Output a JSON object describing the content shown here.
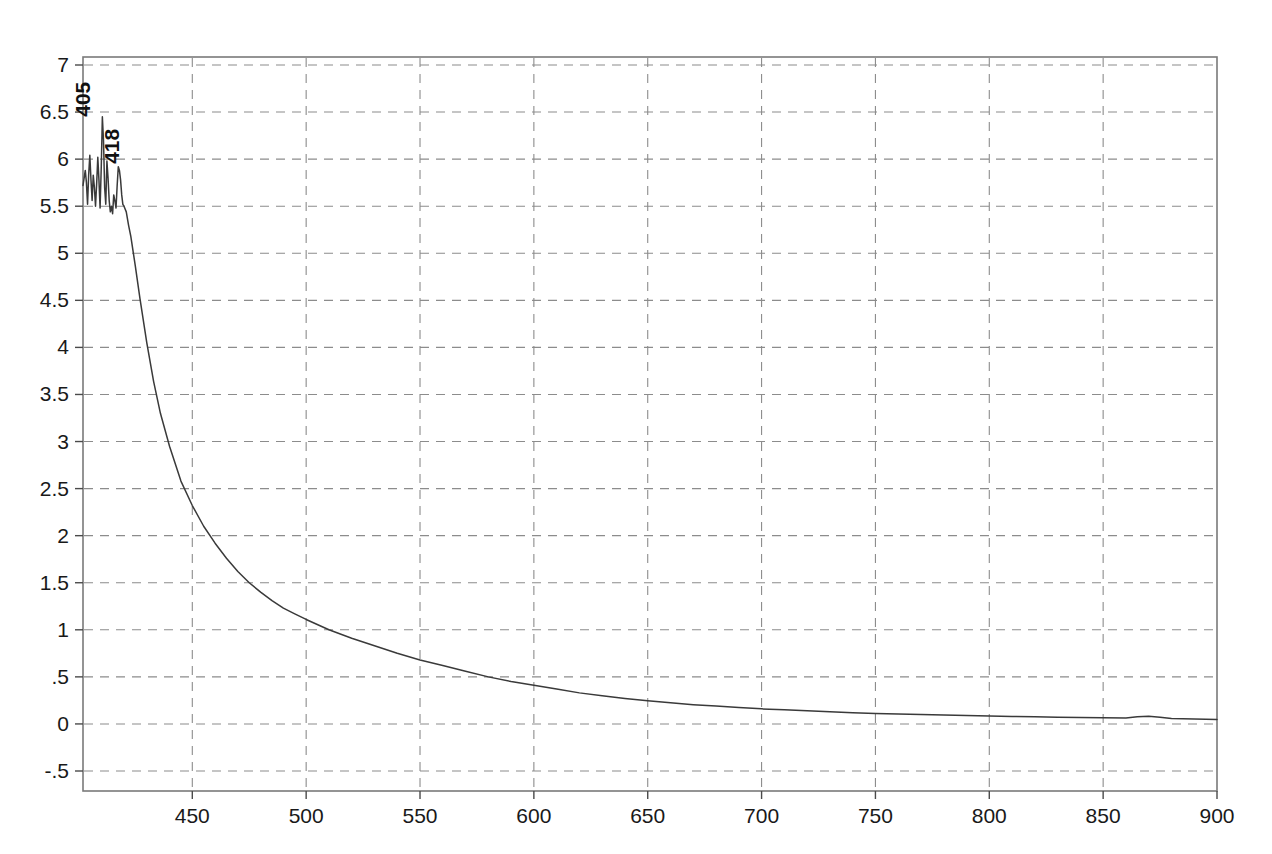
{
  "chart_data": {
    "type": "line",
    "title": "",
    "subtitle": "",
    "xlabel": "",
    "ylabel": "",
    "xlim": [
      402,
      900
    ],
    "ylim": [
      -0.5,
      7.0
    ],
    "grid": true,
    "legend": false,
    "legend_position": "none",
    "x_ticks": [
      450,
      500,
      550,
      600,
      650,
      700,
      750,
      800,
      850,
      900
    ],
    "x_tick_labels": [
      "450",
      "500",
      "550",
      "600",
      "650",
      "700",
      "750",
      "800",
      "850",
      "900"
    ],
    "y_ticks": [
      7,
      6.5,
      6,
      5.5,
      5,
      4.5,
      4,
      3.5,
      3,
      2.5,
      2,
      1.5,
      1,
      0.5,
      0,
      -0.5
    ],
    "y_tick_labels": [
      "7",
      "6.5",
      "6",
      "5.5",
      "5",
      "4.5",
      "4",
      "3.5",
      "3",
      "2.5",
      "2",
      "1.5",
      "1",
      ".5",
      "0",
      "-.5"
    ],
    "annotations": [
      {
        "text": "405",
        "x": 405,
        "y": 6.45,
        "rotation": -90
      },
      {
        "text": "418",
        "x": 418,
        "y": 5.95,
        "rotation": -90
      }
    ],
    "series": [
      {
        "name": "absorbance",
        "color": "#3a3a3a",
        "x": [
          402,
          403,
          403.5,
          404,
          404.5,
          405,
          405.5,
          406,
          406.5,
          407,
          407.5,
          408,
          408.5,
          409,
          409.5,
          410,
          410.5,
          411,
          411.5,
          412,
          412.5,
          413,
          413.5,
          414,
          414.5,
          415,
          415.5,
          416,
          416.5,
          417,
          417.5,
          418,
          418.5,
          419,
          419.5,
          420,
          421,
          422,
          423,
          424,
          425,
          427,
          430,
          433,
          436,
          440,
          445,
          450,
          455,
          460,
          465,
          470,
          475,
          480,
          485,
          490,
          495,
          500,
          510,
          520,
          530,
          540,
          550,
          560,
          570,
          580,
          590,
          600,
          610,
          620,
          630,
          640,
          650,
          660,
          670,
          680,
          690,
          700,
          710,
          720,
          730,
          740,
          750,
          760,
          770,
          780,
          790,
          800,
          810,
          820,
          830,
          840,
          850,
          860,
          865,
          870,
          875,
          880,
          885,
          890,
          895,
          900
        ],
        "values": [
          5.72,
          5.88,
          5.75,
          5.52,
          5.84,
          6.04,
          5.78,
          5.56,
          5.83,
          5.7,
          5.5,
          5.74,
          6.02,
          5.78,
          5.48,
          5.9,
          6.45,
          6.2,
          5.7,
          5.52,
          5.98,
          5.8,
          5.56,
          5.44,
          5.5,
          5.42,
          5.62,
          5.56,
          5.48,
          5.72,
          5.92,
          5.88,
          5.78,
          5.62,
          5.52,
          5.5,
          5.44,
          5.3,
          5.18,
          5.02,
          4.86,
          4.52,
          4.05,
          3.64,
          3.3,
          2.95,
          2.58,
          2.32,
          2.1,
          1.92,
          1.76,
          1.62,
          1.5,
          1.4,
          1.31,
          1.23,
          1.17,
          1.11,
          1.0,
          0.91,
          0.83,
          0.75,
          0.68,
          0.62,
          0.56,
          0.5,
          0.45,
          0.41,
          0.37,
          0.33,
          0.3,
          0.27,
          0.245,
          0.225,
          0.205,
          0.19,
          0.175,
          0.16,
          0.15,
          0.14,
          0.13,
          0.12,
          0.112,
          0.105,
          0.1,
          0.095,
          0.09,
          0.085,
          0.08,
          0.076,
          0.072,
          0.068,
          0.065,
          0.062,
          0.075,
          0.082,
          0.072,
          0.058,
          0.054,
          0.052,
          0.05,
          0.048
        ]
      }
    ]
  },
  "plot": {
    "frame_color": "#7a7a7a",
    "grid_color": "#8c8c8c",
    "background": "#ffffff",
    "curve_color": "#3a3a3a",
    "label_color": "#191919"
  }
}
